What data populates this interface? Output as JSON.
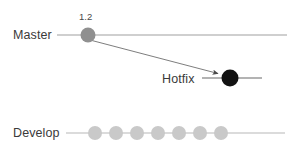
{
  "diagram": {
    "type": "git-branch-graph",
    "background_color": "#ffffff",
    "branches": [
      {
        "id": "master",
        "label": "Master",
        "label_x": 13,
        "label_y": 29,
        "line_color": "#bfbfbf",
        "line_y": 35,
        "line_x1": 57,
        "line_x2": 287,
        "node_color": "#909090",
        "nodes": [
          {
            "x": 88,
            "y": 35,
            "r": 7.5,
            "tag": "1.2"
          }
        ]
      },
      {
        "id": "hotfix",
        "label": "Hotfix",
        "label_x": 162,
        "label_y": 73,
        "line_color": "#9a9a9a",
        "line_y": 78,
        "line_x1": 202,
        "line_x2": 262,
        "node_color": "#121212",
        "nodes": [
          {
            "x": 230,
            "y": 78,
            "r": 8.5,
            "tag": ""
          }
        ]
      },
      {
        "id": "develop",
        "label": "Develop",
        "label_x": 13,
        "label_y": 127,
        "line_color": "#cfcfcf",
        "line_y": 133,
        "line_x1": 66,
        "line_x2": 285,
        "node_color": "#c9c9c9",
        "nodes": [
          {
            "x": 95,
            "y": 133,
            "r": 7,
            "tag": ""
          },
          {
            "x": 116,
            "y": 133,
            "r": 7,
            "tag": ""
          },
          {
            "x": 137,
            "y": 133,
            "r": 7,
            "tag": ""
          },
          {
            "x": 158,
            "y": 133,
            "r": 7,
            "tag": ""
          },
          {
            "x": 179,
            "y": 133,
            "r": 7,
            "tag": ""
          },
          {
            "x": 200,
            "y": 133,
            "r": 7,
            "tag": ""
          },
          {
            "x": 221,
            "y": 133,
            "r": 7,
            "tag": ""
          }
        ]
      }
    ],
    "connector": {
      "id": "master-to-hotfix",
      "from_branch": "master",
      "to_branch": "hotfix",
      "x1": 90,
      "y1": 40,
      "x2": 220,
      "y2": 74,
      "color": "#6e6e6e",
      "arrowhead": true
    },
    "tags": [
      {
        "id": "tag-1-2",
        "text": "1.2",
        "x": 79,
        "y": 12,
        "color": "#4a4a4a"
      }
    ],
    "colors": {
      "master_node": "#909090",
      "hotfix_node": "#121212",
      "develop_node": "#c9c9c9",
      "master_line": "#bfbfbf",
      "hotfix_line": "#9a9a9a",
      "develop_line": "#cfcfcf",
      "arrow": "#6e6e6e",
      "text": "#3a3a3a"
    }
  }
}
